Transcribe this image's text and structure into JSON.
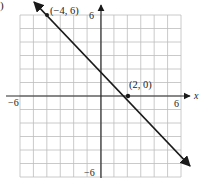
{
  "chart_data": {
    "type": "line",
    "title": "",
    "xlabel": "x",
    "ylabel": "",
    "xlim": [
      -6,
      6
    ],
    "ylim": [
      -6,
      6
    ],
    "grid": true,
    "grid_step": 1,
    "tick_labels": {
      "x_min": "−6",
      "x_max": "6",
      "y_min": "−6",
      "y_max": "6"
    },
    "series": [
      {
        "name": "line through (−4, 6) and (2, 0)",
        "equation": "y = -x + 2",
        "points": [
          [
            -4,
            6
          ],
          [
            2,
            0
          ]
        ],
        "arrows": "both"
      }
    ],
    "annotations": [
      {
        "text": "(−4, 6)",
        "x": -4,
        "y": 6
      },
      {
        "text": "(2, 0)",
        "x": 2,
        "y": 0
      }
    ]
  },
  "labels": {
    "corner_mark": ")",
    "point_a": "(−4, 6)",
    "point_b": "(2, 0)",
    "y_max": "6",
    "y_min": "−6",
    "x_min": "−6",
    "x_max": "6",
    "x_axis": "x"
  },
  "colors": {
    "grid": "#bdbdbd",
    "axis": "#2a2a2a",
    "line": "#1a1a1a",
    "text": "#222222"
  }
}
